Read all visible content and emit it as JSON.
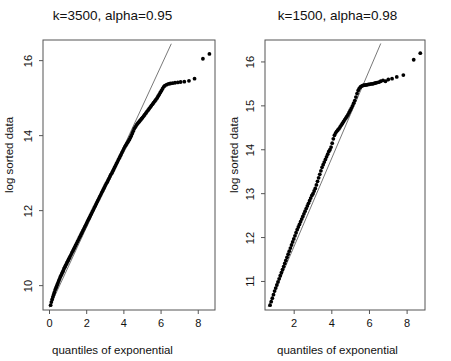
{
  "figure": {
    "background": "#ffffff",
    "point_color": "#000000",
    "line_color": "#555555",
    "frame_color": "#555555"
  },
  "panels": [
    {
      "id": "panel-left",
      "title": "k=3500, alpha=0.95",
      "xlabel": "quantiles of exponential",
      "ylabel": "log sorted data",
      "xticks": [
        "0",
        "2",
        "4",
        "6",
        "8"
      ],
      "yticks": [
        "10",
        "12",
        "14",
        "16"
      ]
    },
    {
      "id": "panel-right",
      "title": "k=1500, alpha=0.98",
      "xlabel": "quantiles of exponential",
      "ylabel": "log sorted data",
      "xticks": [
        "2",
        "4",
        "6",
        "8"
      ],
      "yticks": [
        "11",
        "12",
        "13",
        "14",
        "15",
        "16"
      ]
    }
  ],
  "chart_data": [
    {
      "type": "scatter",
      "title": "k=3500, alpha=0.95",
      "xlabel": "quantiles of exponential",
      "ylabel": "log sorted data",
      "xlim": [
        -0.35,
        8.9
      ],
      "ylim": [
        9.35,
        16.55
      ],
      "xticks": [
        0,
        2,
        4,
        6,
        8
      ],
      "yticks": [
        10,
        12,
        14,
        16
      ],
      "grid": false,
      "legend": null,
      "reference_line": {
        "type": "line",
        "x": [
          0.0,
          6.55
        ],
        "y": [
          9.42,
          16.45
        ],
        "color": "#555555",
        "width": 0.8
      },
      "series": [
        {
          "name": "sorted log data vs exponential quantiles",
          "marker": "filled-circle",
          "color": "#000000",
          "x": [
            0.06,
            0.1,
            0.14,
            0.18,
            0.22,
            0.26,
            0.3,
            0.34,
            0.38,
            0.42,
            0.46,
            0.5,
            0.54,
            0.58,
            0.62,
            0.66,
            0.7,
            0.74,
            0.78,
            0.82,
            0.86,
            0.9,
            0.94,
            0.98,
            1.02,
            1.06,
            1.1,
            1.15,
            1.2,
            1.25,
            1.3,
            1.35,
            1.4,
            1.45,
            1.5,
            1.55,
            1.6,
            1.65,
            1.7,
            1.75,
            1.8,
            1.85,
            1.9,
            1.95,
            2.0,
            2.05,
            2.1,
            2.15,
            2.2,
            2.25,
            2.3,
            2.35,
            2.4,
            2.45,
            2.5,
            2.55,
            2.6,
            2.65,
            2.7,
            2.75,
            2.8,
            2.85,
            2.9,
            2.95,
            3.0,
            3.05,
            3.1,
            3.15,
            3.2,
            3.25,
            3.3,
            3.35,
            3.4,
            3.45,
            3.5,
            3.55,
            3.6,
            3.65,
            3.7,
            3.75,
            3.8,
            3.85,
            3.9,
            3.95,
            4.0,
            4.05,
            4.1,
            4.15,
            4.2,
            4.25,
            4.3,
            4.35,
            4.4,
            4.45,
            4.5,
            4.55,
            4.6,
            4.65,
            4.7,
            4.75,
            4.8,
            4.85,
            4.9,
            4.95,
            5.0,
            5.06,
            5.12,
            5.18,
            5.24,
            5.3,
            5.36,
            5.42,
            5.48,
            5.54,
            5.6,
            5.66,
            5.72,
            5.78,
            5.84,
            5.9,
            5.96,
            6.02,
            6.08,
            6.14,
            6.2,
            6.3,
            6.4,
            6.5,
            6.62,
            6.75,
            6.9,
            7.05,
            7.25,
            7.5,
            7.8,
            8.25,
            8.6
          ],
          "y": [
            9.48,
            9.56,
            9.63,
            9.7,
            9.76,
            9.82,
            9.88,
            9.93,
            9.98,
            10.03,
            10.08,
            10.13,
            10.18,
            10.23,
            10.27,
            10.31,
            10.36,
            10.4,
            10.45,
            10.49,
            10.53,
            10.57,
            10.61,
            10.65,
            10.69,
            10.73,
            10.77,
            10.82,
            10.87,
            10.92,
            10.97,
            11.02,
            11.07,
            11.12,
            11.17,
            11.22,
            11.27,
            11.32,
            11.37,
            11.42,
            11.47,
            11.52,
            11.57,
            11.62,
            11.67,
            11.72,
            11.77,
            11.82,
            11.87,
            11.92,
            11.97,
            12.02,
            12.07,
            12.12,
            12.17,
            12.22,
            12.27,
            12.32,
            12.37,
            12.42,
            12.47,
            12.52,
            12.57,
            12.62,
            12.67,
            12.72,
            12.76,
            12.81,
            12.86,
            12.91,
            12.96,
            13.0,
            13.05,
            13.1,
            13.15,
            13.2,
            13.25,
            13.3,
            13.35,
            13.4,
            13.45,
            13.5,
            13.55,
            13.6,
            13.65,
            13.7,
            13.74,
            13.78,
            13.82,
            13.86,
            13.9,
            13.95,
            14.0,
            14.06,
            14.12,
            14.18,
            14.22,
            14.26,
            14.3,
            14.33,
            14.36,
            14.39,
            14.42,
            14.45,
            14.48,
            14.52,
            14.56,
            14.6,
            14.64,
            14.68,
            14.72,
            14.76,
            14.8,
            14.84,
            14.88,
            14.92,
            14.96,
            15.0,
            15.05,
            15.1,
            15.15,
            15.2,
            15.25,
            15.3,
            15.33,
            15.36,
            15.38,
            15.39,
            15.4,
            15.41,
            15.42,
            15.43,
            15.44,
            15.46,
            15.52,
            16.05,
            16.18
          ]
        }
      ]
    },
    {
      "type": "scatter",
      "title": "k=1500, alpha=0.98",
      "xlabel": "quantiles of exponential",
      "ylabel": "log sorted data",
      "xlim": [
        0.45,
        8.95
      ],
      "ylim": [
        10.35,
        16.5
      ],
      "xticks": [
        2,
        4,
        6,
        8
      ],
      "yticks": [
        11,
        12,
        13,
        14,
        15,
        16
      ],
      "grid": false,
      "legend": null,
      "reference_line": {
        "type": "line",
        "x": [
          0.62,
          6.6
        ],
        "y": [
          10.42,
          16.42
        ],
        "color": "#555555",
        "width": 0.8
      },
      "series": [
        {
          "name": "sorted log data vs exponential quantiles",
          "marker": "filled-circle",
          "color": "#000000",
          "x": [
            0.72,
            0.78,
            0.84,
            0.9,
            0.96,
            1.02,
            1.08,
            1.14,
            1.2,
            1.26,
            1.32,
            1.38,
            1.44,
            1.5,
            1.56,
            1.62,
            1.68,
            1.74,
            1.8,
            1.86,
            1.92,
            1.98,
            2.04,
            2.1,
            2.16,
            2.22,
            2.28,
            2.34,
            2.4,
            2.46,
            2.52,
            2.58,
            2.64,
            2.7,
            2.76,
            2.82,
            2.88,
            2.94,
            3.0,
            3.06,
            3.12,
            3.18,
            3.24,
            3.3,
            3.36,
            3.42,
            3.48,
            3.54,
            3.6,
            3.66,
            3.72,
            3.78,
            3.84,
            3.9,
            3.96,
            4.02,
            4.08,
            4.14,
            4.2,
            4.26,
            4.32,
            4.38,
            4.44,
            4.5,
            4.56,
            4.62,
            4.68,
            4.74,
            4.8,
            4.86,
            4.92,
            4.98,
            5.04,
            5.1,
            5.16,
            5.22,
            5.28,
            5.34,
            5.4,
            5.46,
            5.52,
            5.58,
            5.64,
            5.7,
            5.76,
            5.82,
            5.88,
            5.94,
            6.0,
            6.08,
            6.16,
            6.24,
            6.32,
            6.4,
            6.5,
            6.6,
            6.72,
            6.85,
            7.0,
            7.2,
            7.45,
            7.8,
            8.35,
            8.7
          ],
          "y": [
            10.46,
            10.54,
            10.62,
            10.7,
            10.78,
            10.85,
            10.92,
            10.99,
            11.06,
            11.13,
            11.2,
            11.27,
            11.34,
            11.41,
            11.48,
            11.55,
            11.62,
            11.69,
            11.76,
            11.83,
            11.9,
            11.97,
            12.04,
            12.11,
            12.18,
            12.24,
            12.3,
            12.36,
            12.42,
            12.48,
            12.54,
            12.6,
            12.66,
            12.72,
            12.78,
            12.84,
            12.9,
            12.96,
            13.0,
            13.06,
            13.12,
            13.2,
            13.28,
            13.36,
            13.44,
            13.52,
            13.6,
            13.66,
            13.72,
            13.78,
            13.84,
            13.9,
            13.96,
            14.0,
            14.06,
            14.15,
            14.25,
            14.33,
            14.38,
            14.42,
            14.45,
            14.48,
            14.52,
            14.56,
            14.6,
            14.64,
            14.68,
            14.72,
            14.76,
            14.8,
            14.85,
            14.9,
            14.95,
            15.0,
            15.06,
            15.12,
            15.2,
            15.28,
            15.35,
            15.4,
            15.43,
            15.45,
            15.46,
            15.47,
            15.47,
            15.48,
            15.48,
            15.49,
            15.49,
            15.5,
            15.5,
            15.51,
            15.52,
            15.53,
            15.54,
            15.56,
            15.58,
            15.56,
            15.6,
            15.62,
            15.66,
            15.7,
            16.05,
            16.2
          ]
        }
      ]
    }
  ]
}
